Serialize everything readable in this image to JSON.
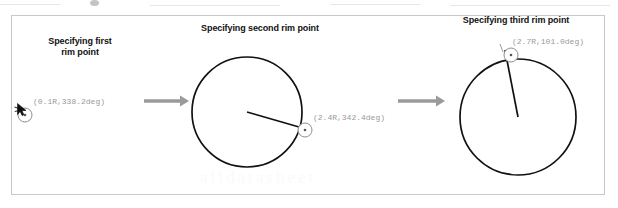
{
  "figure": {
    "panels": [
      {
        "id": "first",
        "title": "Specifying first\nrim point",
        "coord_label": "(0.1R,338.2deg)",
        "has_circle": false,
        "has_cursor": true,
        "marker": {
          "cx": 25,
          "cy": 115,
          "r": 7
        }
      },
      {
        "id": "second",
        "title": "Specifying second rim point",
        "coord_label": "(2.4R,342.4deg)",
        "has_circle": true,
        "has_cursor": false,
        "circle": {
          "cx": 247,
          "cy": 112,
          "r": 55
        },
        "radius_line": {
          "x1": 247,
          "y1": 112,
          "x2": 299,
          "y2": 127
        },
        "marker": {
          "cx": 305,
          "cy": 130,
          "r": 7
        }
      },
      {
        "id": "third",
        "title": "Specifying third rim point",
        "coord_label": "(2.7R,101.0deg)",
        "has_circle": true,
        "has_cursor": false,
        "circle": {
          "cx": 518,
          "cy": 117,
          "r": 58
        },
        "radius_line": {
          "x1": 518,
          "y1": 117,
          "x2": 505,
          "y2": 50
        },
        "marker": {
          "cx": 511,
          "cy": 55,
          "r": 7
        }
      }
    ],
    "arrows": [
      {
        "id": "arrow-1-2",
        "x1": 144,
        "y1": 101,
        "x2": 186,
        "y2": 101
      },
      {
        "id": "arrow-2-3",
        "x1": 398,
        "y1": 101,
        "x2": 442,
        "y2": 101
      }
    ],
    "colors": {
      "stroke": "#111111",
      "arrow": "#9a9a9a",
      "label_text": "#9a9a9a",
      "title_text": "#111111",
      "frame_border": "#c9c9c9",
      "background": "#ffffff",
      "watermark": "#fafafa"
    },
    "watermark_text": "alldatasheet"
  }
}
